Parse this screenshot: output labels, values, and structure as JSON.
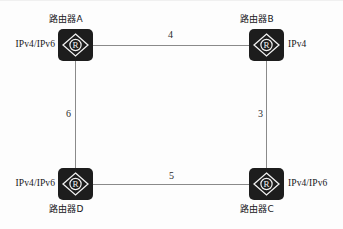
{
  "diagram": {
    "type": "network-topology",
    "background_color": "#fdfdfd",
    "node_color": "#1d1d1d",
    "link_color": "#8a8a8a",
    "text_color": "#17171a",
    "nodes": [
      {
        "id": "A",
        "name_label": "路由器A",
        "name_position": "top",
        "protocol_label": "IPv4/IPv6",
        "protocol_position": "left",
        "icon": "router-icon",
        "icon_glyph": "R",
        "x": 58,
        "y": 29
      },
      {
        "id": "B",
        "name_label": "路由器B",
        "name_position": "top",
        "protocol_label": "IPv4",
        "protocol_position": "right",
        "icon": "router-icon",
        "icon_glyph": "R",
        "x": 249,
        "y": 29
      },
      {
        "id": "C",
        "name_label": "路由器C",
        "name_position": "bottom",
        "protocol_label": "IPv4/IPv6",
        "protocol_position": "right",
        "icon": "router-icon",
        "icon_glyph": "R",
        "x": 249,
        "y": 168
      },
      {
        "id": "D",
        "name_label": "路由器D",
        "name_position": "bottom",
        "protocol_label": "IPv4/IPv6",
        "protocol_position": "left",
        "icon": "router-icon",
        "icon_glyph": "R",
        "x": 58,
        "y": 168
      }
    ],
    "links": [
      {
        "id": "AB",
        "from": "A",
        "to": "B",
        "cost": "4",
        "orientation": "horizontal"
      },
      {
        "id": "BC",
        "from": "B",
        "to": "C",
        "cost": "3",
        "orientation": "vertical"
      },
      {
        "id": "DC",
        "from": "D",
        "to": "C",
        "cost": "5",
        "orientation": "horizontal"
      },
      {
        "id": "AD",
        "from": "A",
        "to": "D",
        "cost": "6",
        "orientation": "vertical"
      }
    ]
  }
}
